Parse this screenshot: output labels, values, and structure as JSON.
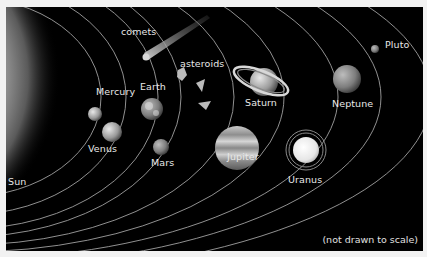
{
  "diagram": {
    "note": "(not drawn to scale)",
    "labels": {
      "sun": "Sun",
      "mercury": "Mercury",
      "venus": "Venus",
      "earth": "Earth",
      "mars": "Mars",
      "asteroids": "asteroids",
      "comets": "comets",
      "jupiter": "Jupiter",
      "saturn": "Saturn",
      "uranus": "Uranus",
      "neptune": "Neptune",
      "pluto": "Pluto"
    },
    "colors": {
      "background": "#000000",
      "frame": "#f2f2f2",
      "orbit": "#bdbdbd",
      "label": "#e8e8e8",
      "sun": "#b3b3b3"
    }
  }
}
